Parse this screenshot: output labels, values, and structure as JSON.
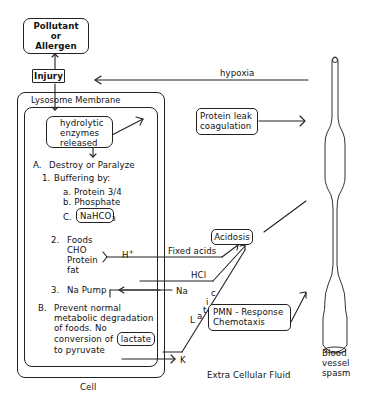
{
  "diagram": {
    "nodes": {
      "pollutant": {
        "line1": "Pollutant",
        "line2": "or",
        "line3": "Allergen"
      },
      "injury": "Injury",
      "lysosome_membrane": "Lysosome Membrane",
      "hydrolytic": {
        "line1": "hydrolytic",
        "line2": "enzymes",
        "line3": "released"
      },
      "protein_leak": {
        "line1": "Protein leak",
        "line2": "coagulation"
      },
      "acidosis": "Acidosis",
      "pmn": {
        "line1": "PMN - Response",
        "line2": "Chemotaxis"
      }
    },
    "cell_content": {
      "A_label": "A.",
      "A_text": "Destroy or Paralyze",
      "item1_num": "1.",
      "item1_text": "Buffering by:",
      "sub_a": "a.  Protein 3/4",
      "sub_b": "b.  Phosphate",
      "sub_c_label": "C.",
      "sub_c_value": "NaHCO",
      "sub_c_subscript": "3",
      "item2_num": "2.",
      "item2_text": "Foods",
      "food1": "CHO",
      "food2": "Protein",
      "food3": "fat",
      "item3_num": "3.",
      "item3_text": "Na Pump",
      "B_label": "B.",
      "B_line1": "Prevent normal",
      "B_line2": "metabolic degradation",
      "B_line3": "of foods.  No",
      "B_line4": "conversion of",
      "B_lactate": "lactate",
      "B_line5": "to pyruvate"
    },
    "edge_labels": {
      "hypoxia": "hypoxia",
      "h_plus": "H",
      "h_plus_sup": "+",
      "fixed_acids": "Fixed acids",
      "hcl": "HCl",
      "na": "Na",
      "k": "K",
      "lactic_L": "L",
      "lactic_a": "a",
      "lactic_t": "t",
      "lactic_i": "i",
      "lactic_c": "c"
    },
    "region_labels": {
      "cell": "Cell",
      "extra_cellular": "Extra Cellular Fluid",
      "blood_vessel_1": "Blood",
      "blood_vessel_2": "vessel",
      "blood_vessel_3": "spasm"
    }
  }
}
